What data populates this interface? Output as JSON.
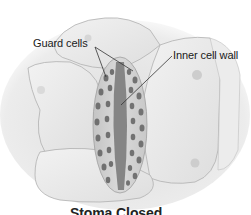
{
  "diagram": {
    "labels": {
      "guard_cells": "Guard cells",
      "inner_cell_wall": "Inner cell wall"
    },
    "caption_partial": "Stoma Closed",
    "colors": {
      "background": "#ffffff",
      "epidermal_cell": "#e6e6e6",
      "cell_outline": "#a8a8a8",
      "guard_cell_fill": "#c9c9c9",
      "inner_wall": "#7a7a7a",
      "chloroplast": "#6e6e6e",
      "nucleus": "#cfcfcf",
      "text": "#1a1a1a"
    }
  }
}
